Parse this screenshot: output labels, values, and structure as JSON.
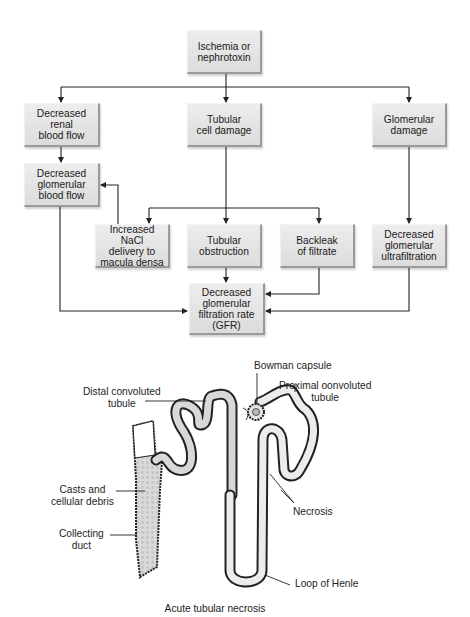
{
  "flowchart": {
    "nodes": {
      "cause": "Ischemia or\nnephrotoxin",
      "renal_blood_flow": "Decreased renal\nblood flow",
      "tubular_damage": "Tubular\ncell damage",
      "glomerular_damage": "Glomerular\ndamage",
      "glomerular_blood_flow": "Decreased\nglomerular\nblood flow",
      "nacl_delivery": "Increased NaCl\ndelivery to\nmacula densa",
      "tubular_obstruction": "Tubular\nobstruction",
      "backleak": "Backleak\nof filtrate",
      "ultrafiltration": "Decreased\nglomerular\nultrafiltration",
      "gfr": "Decreased\nglomerular\nfiltration rate\n(GFR)"
    },
    "edges": [
      [
        "cause",
        "renal_blood_flow"
      ],
      [
        "cause",
        "tubular_damage"
      ],
      [
        "cause",
        "glomerular_damage"
      ],
      [
        "renal_blood_flow",
        "glomerular_blood_flow"
      ],
      [
        "nacl_delivery",
        "glomerular_blood_flow"
      ],
      [
        "tubular_damage",
        "nacl_delivery"
      ],
      [
        "tubular_damage",
        "tubular_obstruction"
      ],
      [
        "tubular_damage",
        "backleak"
      ],
      [
        "glomerular_damage",
        "ultrafiltration"
      ],
      [
        "glomerular_blood_flow",
        "gfr"
      ],
      [
        "tubular_obstruction",
        "gfr"
      ],
      [
        "backleak",
        "gfr"
      ],
      [
        "ultrafiltration",
        "gfr"
      ]
    ],
    "colors": {
      "box_fill": "#e4e4e4",
      "box_edge": "#9a9a9a",
      "line": "#222222"
    }
  },
  "illustration": {
    "labels": {
      "bowman": "Bowman capsule",
      "proximal": "Proximal oonvoluted\ntubule",
      "distal": "Distal convoluted\ntubule",
      "casts": "Casts and\ncellular debris",
      "collecting": "Collecting\nduct",
      "necrosis": "Necrosis",
      "loop": "Loop of Henle"
    },
    "caption": "Acute tubular necrosis"
  }
}
